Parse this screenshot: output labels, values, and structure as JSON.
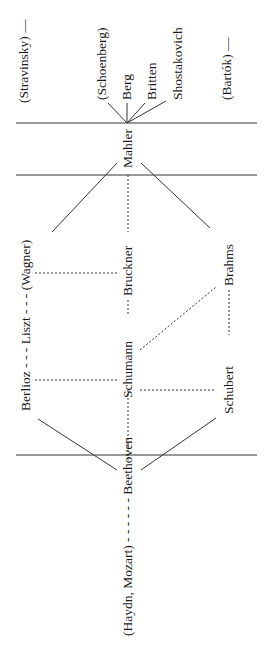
{
  "diagram": {
    "orientation": "rotated-90",
    "composers": {
      "stravinsky": "(Stravinsky) —",
      "schoenberg": "(Schoenberg)",
      "berg": "Berg",
      "britten": "Britten",
      "shostakovich": "Shostakovich",
      "bartok": "(Bartók) —",
      "mahler": "Mahler",
      "bruckner": "Bruckner",
      "brahms": "Brahms",
      "berlioz_liszt_wagner": "Berlioz - - - Liszt - - - (Wagner)",
      "schumann": "Schumann",
      "schubert": "Schubert",
      "haydn_mozart_beethoven": "(Haydn, Mozart) - - - - - - Beethoven"
    },
    "line_color": "#333333"
  }
}
